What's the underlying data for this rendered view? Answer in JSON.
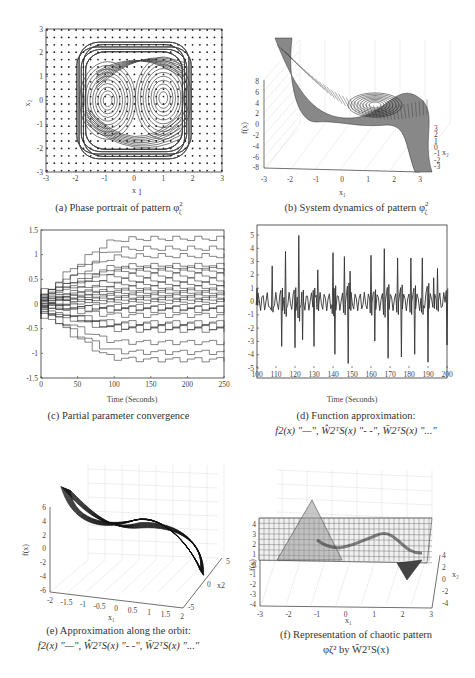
{
  "panels": {
    "a": {
      "caption": "(a) Phase portrait of pattern φ",
      "caption_sup": "2",
      "caption_sub": "ζ",
      "xlabel": "x1",
      "ylabel": "x2",
      "xticks": [
        "-3",
        "-2",
        "-1",
        "0",
        "1",
        "2",
        "3"
      ],
      "yticks": [
        "3",
        "2",
        "1",
        "0",
        "-1",
        "-2",
        "-3"
      ]
    },
    "b": {
      "caption": "(b) System dynamics of pattern φ",
      "caption_sup": "2",
      "caption_sub": "ζ",
      "xlabel": "x1",
      "ylabel": "f(x)",
      "zlabel": "x2",
      "xticks": [
        "-3",
        "-2",
        "-1",
        "0",
        "1",
        "2",
        "3"
      ],
      "yticks": [
        "8",
        "6",
        "4",
        "2",
        "0",
        "-2",
        "-4",
        "-6",
        "-8"
      ],
      "x2ticks": [
        "3",
        "2",
        "1",
        "0",
        "-1",
        "-2",
        "-3"
      ]
    },
    "c": {
      "caption": "(c) Partial parameter convergence",
      "xlabel": "Time (Seconds)",
      "xticks": [
        "0",
        "50",
        "100",
        "150",
        "200",
        "250"
      ],
      "yticks": [
        "1.5",
        "1",
        "0.5",
        "0",
        "-0.5",
        "-1",
        "-1.5"
      ]
    },
    "d": {
      "caption_line1": "(d) Function approximation:",
      "caption_line2": "f2(x) \"—\", Ŵ2ᵀS(x) \"- -\", W̄2ᵀS(x) \"...\"",
      "xlabel": "Time (Seconds)",
      "xticks": [
        "100",
        "110",
        "120",
        "130",
        "140",
        "150",
        "160",
        "170",
        "180",
        "190",
        "200"
      ],
      "yticks": [
        "5",
        "4",
        "3",
        "2",
        "1",
        "0",
        "-1",
        "-2",
        "-3",
        "-4",
        "-5"
      ]
    },
    "e": {
      "caption_line1": "(e) Approximation along the orbit:",
      "caption_line2": "f2(x) \"—\", Ŵ2ᵀS(x) \"- -\", W̄2ᵀS(x) \"...\"",
      "xlabel": "x1",
      "ylabel": "f(x)",
      "zlabel": "x2",
      "xticks": [
        "-2",
        "-1.5",
        "-1",
        "-0.5",
        "0",
        "0.5",
        "1",
        "1.5",
        "2"
      ],
      "yticks": [
        "6",
        "4",
        "2",
        "0",
        "-2",
        "-4",
        "-6"
      ],
      "x2ticks": [
        "5",
        "0",
        "-5"
      ]
    },
    "f": {
      "caption_line1": "(f) Representation of chaotic pattern",
      "caption_line2": "φζ² by W̄2ᵀS(x)",
      "xlabel": "x1",
      "ylabel": "f(x)",
      "zlabel": "x2",
      "xticks": [
        "-3",
        "-2",
        "-1",
        "0",
        "1",
        "2",
        "3"
      ],
      "yticks": [
        "4",
        "3",
        "2",
        "1",
        "0",
        "-1",
        "-2",
        "-3",
        "-4"
      ],
      "x2ticks": [
        "4",
        "2",
        "0",
        "-2",
        "-4"
      ]
    }
  },
  "chart_data": [
    {
      "type": "scatter",
      "title": "(a) Phase portrait of pattern φζ²",
      "xlabel": "x1",
      "ylabel": "x2",
      "xlim": [
        -3,
        3
      ],
      "ylim": [
        -3,
        3
      ],
      "grid_points": "9x? uniform dot grid every 0.25 over [-3,3]²",
      "trajectory": "double-scroll chaotic orbit, |x1| ≤ ~1.9, |x2| ≤ ~2.5, foci near (-0.9,0) and (1,0)"
    },
    {
      "type": "surface",
      "title": "(b) System dynamics of pattern φζ²",
      "xlabel": "x1",
      "ylabel": "x2",
      "zlabel": "f(x)",
      "xlim": [
        -3,
        3
      ],
      "ylim": [
        -3,
        3
      ],
      "zlim": [
        -8,
        8
      ],
      "description": "cubic-shaped surface f(x) decreasing from +8 at x1=-3 to -8 at x1=3 with orbit overlaid"
    },
    {
      "type": "line",
      "title": "(c) Partial parameter convergence",
      "xlabel": "Time (Seconds)",
      "ylabel": "",
      "xlim": [
        0,
        250
      ],
      "ylim": [
        -1.5,
        1.5
      ],
      "series_summary": "many step-like parameter trajectories; upper envelope reaching ~1.45 near t=225, lower envelope ~-1.3 near t=220, dense band around 0"
    },
    {
      "type": "line",
      "title": "(d) Function approximation",
      "xlabel": "Time (Seconds)",
      "ylabel": "",
      "xlim": [
        100,
        200
      ],
      "ylim": [
        -5.5,
        5.5
      ],
      "x": [
        100,
        108,
        113,
        115,
        120,
        122,
        124,
        130,
        132,
        140,
        141,
        146,
        148,
        149,
        160,
        162,
        167,
        169,
        174,
        176,
        181,
        183,
        187,
        190,
        193,
        195,
        200
      ],
      "series": [
        {
          "name": "f2(x)",
          "values": [
            1,
            2.7,
            -3.4,
            3.8,
            -3.5,
            5.0,
            -2.9,
            -3.4,
            2.4,
            3.7,
            -4.0,
            3.4,
            -4.7,
            2.3,
            3.5,
            -3.0,
            4.0,
            -4.3,
            3.3,
            -4.2,
            3.3,
            -4.0,
            3.3,
            -4.6,
            1.8,
            2.5,
            -3.3
          ]
        }
      ]
    },
    {
      "type": "line3d",
      "title": "(e) Approximation along the orbit",
      "xlabel": "x1",
      "ylabel": "x2",
      "zlabel": "f(x)",
      "xlim": [
        -2,
        2
      ],
      "ylim": [
        -5,
        5
      ],
      "zlim": [
        -6,
        6
      ]
    },
    {
      "type": "surface",
      "title": "(f) Representation of chaotic pattern φζ² by W̄2ᵀS(x)",
      "xlabel": "x1",
      "ylabel": "x2",
      "zlabel": "f(x)",
      "xlim": [
        -3,
        3
      ],
      "ylim": [
        -4,
        4
      ],
      "zlim": [
        -4,
        4
      ],
      "description": "flat mesh at ~1 with peak ~4.5 near x1=-1.5 and dip ~-1 near x1=2"
    }
  ]
}
